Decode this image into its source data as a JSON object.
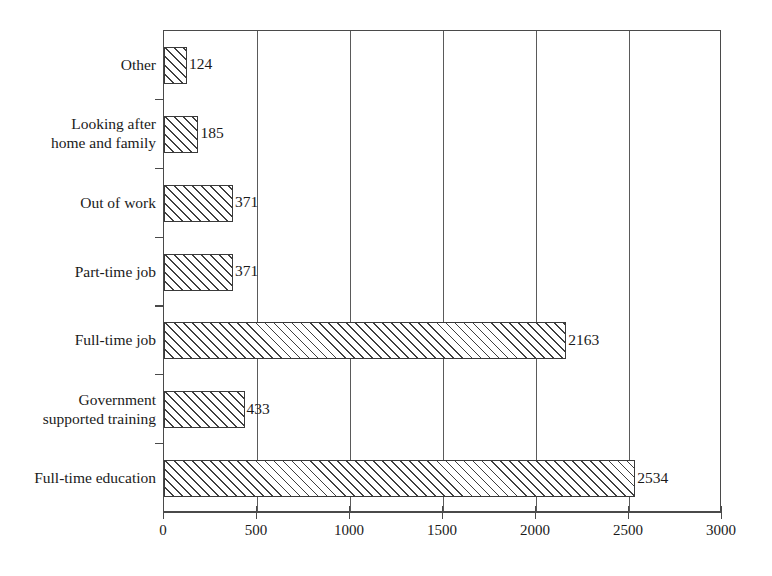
{
  "chart_data": {
    "type": "bar",
    "orientation": "horizontal",
    "title": "",
    "subtitle": "",
    "xlabel": "",
    "ylabel": "",
    "xlim": [
      0,
      3000
    ],
    "ylim": [
      0,
      7
    ],
    "grid": true,
    "legend": null,
    "legend_position": "none",
    "xticks": [
      0,
      500,
      1000,
      1500,
      2000,
      2500,
      3000
    ],
    "xtick_labels": [
      "0",
      "500",
      "1000",
      "1500",
      "2000",
      "2500",
      "3000"
    ],
    "categories": [
      "Other",
      "Looking after\nhome and family",
      "Out of work",
      "Part-time job",
      "Full-time job",
      "Government\nsupported training",
      "Full-time education"
    ],
    "values": [
      124,
      185,
      371,
      371,
      2163,
      433,
      2534
    ],
    "data_labels": [
      "124",
      "185",
      "371",
      "371",
      "2163",
      "433",
      "2534"
    ],
    "bar_style": {
      "fill": "#ffffff",
      "hatch": "/",
      "hatch_color": "#3f3f3f",
      "edge_color": "#3a3a3a"
    },
    "axis_color": "#4a4a4a",
    "grid_color": "#5a5a5a",
    "background": "#ffffff"
  }
}
